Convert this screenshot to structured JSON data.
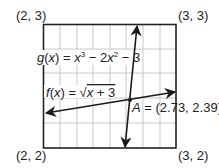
{
  "corners": {
    "top_left": "(2, 3)",
    "top_right": "(3, 3)",
    "bottom_left": "(2, 2)",
    "bottom_right": "(3, 2)"
  },
  "functions": {
    "g": {
      "name": "g(x)",
      "expression": "= x³ − 2x² − 3"
    },
    "f": {
      "name": "f(x)",
      "expression": "= √x + 3"
    }
  },
  "intersection": {
    "label": "A = (2.73, 2.39)",
    "x": 2.73,
    "y": 2.39
  },
  "grid": {
    "x_range": [
      2,
      3
    ],
    "y_range": [
      2,
      3
    ],
    "columns": 8,
    "rows": 5
  },
  "colors": {
    "line": "#1a1a1a",
    "grid": "#c8c8c8",
    "frame": "#222222"
  }
}
